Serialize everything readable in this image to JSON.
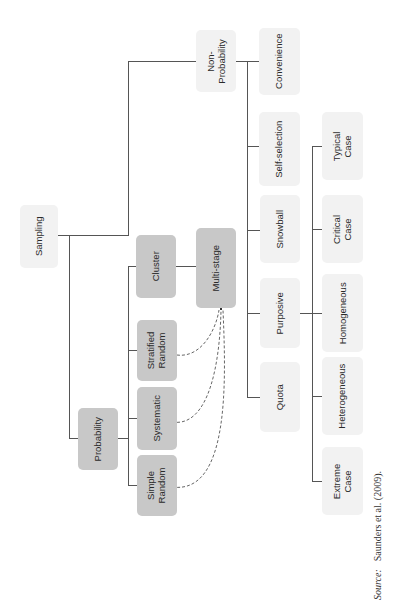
{
  "diagram": {
    "orientation": "rotated 90 degrees counter-clockwise",
    "root": "Sampling",
    "nodes": {
      "sampling": "Sampling",
      "probability": "Probability",
      "non_probability": "Non-\nProbability",
      "cluster": "Cluster",
      "multi_stage": "Multi-stage",
      "stratified_random": "Stratified\nRandom",
      "systematic": "Systematic",
      "simple_random": "Simple\nRandom",
      "convenience": "Convenience",
      "self_selection": "Self-selection",
      "snowball": "Snowball",
      "purposive": "Purposive",
      "quota": "Quota",
      "typical_case": "Typical\nCase",
      "critical_case": "Critical\nCase",
      "homogeneous": "Homogeneous",
      "heterogeneous": "Heterogeneous",
      "extreme_case": "Extreme\nCase"
    },
    "tree": {
      "Sampling": [
        "Probability",
        "Non-Probability"
      ],
      "Probability": [
        "Cluster",
        "Stratified Random",
        "Systematic",
        "Simple Random"
      ],
      "Cluster": [
        "Multi-stage"
      ],
      "Non-Probability": [
        "Convenience",
        "Self-selection",
        "Snowball",
        "Purposive",
        "Quota"
      ],
      "Purposive": [
        "Typical Case",
        "Critical Case",
        "Homogeneous",
        "Heterogeneous",
        "Extreme Case"
      ]
    },
    "dashed_links": [
      {
        "from": "Stratified Random",
        "to": "Multi-stage"
      },
      {
        "from": "Systematic",
        "to": "Multi-stage"
      },
      {
        "from": "Simple Random",
        "to": "Multi-stage"
      }
    ],
    "colors": {
      "probability_branch_fill": "#c8c8c8",
      "non_probability_branch_fill": "#f2f2f2",
      "line": "#555555"
    }
  },
  "source": {
    "label": "Source:",
    "text": "Saunders et al. (2009)."
  }
}
